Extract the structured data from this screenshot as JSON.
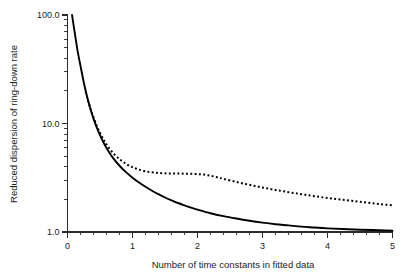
{
  "figure": {
    "background_color": "#ffffff",
    "foreground_color": "#1a1a1a",
    "width": 409,
    "height": 276
  },
  "chart_data": {
    "type": "line",
    "title": "",
    "subtitle": "",
    "xlabel": "Number of time constants in fitted data",
    "ylabel": "Reduced dispersion of ring-down rate",
    "xscale": "linear",
    "yscale": "log",
    "xlim": [
      0,
      5
    ],
    "ylim": [
      1.0,
      100.0
    ],
    "grid": false,
    "legend": "none",
    "x_ticks_major": [
      0,
      1,
      2,
      3,
      4,
      5
    ],
    "x_tick_labels": [
      "0",
      "1",
      "2",
      "3",
      "4",
      "5"
    ],
    "x_minor_tick_interval": 0.2,
    "y_ticks_major": [
      1.0,
      10.0,
      100.0
    ],
    "y_tick_labels": [
      "1.0",
      "10.0",
      "100.0"
    ],
    "y_minor_ticks": [
      2,
      3,
      4,
      5,
      6,
      7,
      8,
      9,
      20,
      30,
      40,
      50,
      60,
      70,
      80,
      90
    ],
    "series": [
      {
        "name": "solid-curve",
        "style": "solid",
        "color": "#000000",
        "x": [
          0.07,
          0.1,
          0.13,
          0.16,
          0.2,
          0.25,
          0.3,
          0.35,
          0.4,
          0.45,
          0.5,
          0.55,
          0.6,
          0.7,
          0.8,
          0.9,
          1.0,
          1.1,
          1.2,
          1.3,
          1.4,
          1.5,
          1.6,
          1.7,
          1.8,
          1.9,
          2.0,
          2.2,
          2.4,
          2.6,
          2.8,
          3.0,
          3.2,
          3.4,
          3.6,
          3.8,
          4.0,
          4.5,
          5.0
        ],
        "y": [
          100.0,
          76.0,
          58.0,
          45.0,
          34.0,
          24.0,
          17.8,
          13.8,
          11.1,
          9.2,
          7.8,
          6.75,
          5.95,
          4.82,
          4.08,
          3.56,
          3.17,
          2.86,
          2.61,
          2.4,
          2.23,
          2.08,
          1.96,
          1.85,
          1.76,
          1.68,
          1.61,
          1.49,
          1.4,
          1.33,
          1.27,
          1.22,
          1.18,
          1.15,
          1.12,
          1.1,
          1.08,
          1.05,
          1.03
        ]
      },
      {
        "name": "dotted-curve",
        "style": "dotted",
        "color": "#000000",
        "x": [
          0.28,
          0.32,
          0.36,
          0.4,
          0.45,
          0.5,
          0.55,
          0.6,
          0.7,
          0.8,
          0.9,
          1.0,
          1.1,
          1.2,
          1.3,
          1.4,
          1.5,
          1.6,
          1.7,
          1.8,
          1.9,
          2.0,
          2.1,
          2.2,
          2.3,
          2.4,
          2.6,
          2.8,
          3.0,
          3.2,
          3.4,
          3.6,
          3.8,
          4.0,
          4.2,
          4.4,
          4.6,
          4.8,
          5.0
        ],
        "y": [
          19.6,
          15.9,
          13.3,
          11.4,
          9.5,
          8.2,
          7.2,
          6.4,
          5.35,
          4.7,
          4.25,
          3.95,
          3.76,
          3.63,
          3.55,
          3.5,
          3.47,
          3.46,
          3.46,
          3.45,
          3.44,
          3.42,
          3.38,
          3.3,
          3.2,
          3.09,
          2.89,
          2.72,
          2.57,
          2.44,
          2.33,
          2.23,
          2.14,
          2.06,
          1.99,
          1.93,
          1.87,
          1.81,
          1.76
        ]
      }
    ]
  }
}
